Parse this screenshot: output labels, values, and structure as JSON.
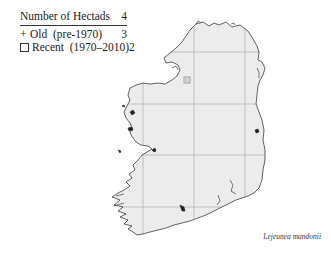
{
  "legend": {
    "title": "Number of Hectads",
    "total": "4",
    "items": [
      {
        "symbol": "plus",
        "glyph": "+",
        "label": "Old  (pre-1970)",
        "count": "3"
      },
      {
        "symbol": "square",
        "glyph": "",
        "label": "Recent  (1970–2010)",
        "count": "2"
      }
    ]
  },
  "map": {
    "region": "Ireland",
    "land_color": "#ececec",
    "coast_color": "#222222",
    "grid_color": "#b5b5b5",
    "grid_x": [
      143,
      194,
      245
    ],
    "grid_y": [
      52,
      104,
      155,
      207
    ],
    "markers": [
      {
        "type": "square",
        "x": 187,
        "y": 80
      }
    ]
  },
  "species": "Lejeunea mandonii"
}
